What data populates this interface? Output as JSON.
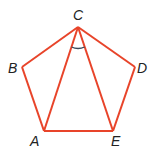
{
  "diagram": {
    "type": "regular-pentagon",
    "stroke_color": "#e8442a",
    "arc_color": "#3b4a5a",
    "label_color": "#222222",
    "vertices": {
      "A": {
        "label": "A",
        "x": 44,
        "y": 131
      },
      "B": {
        "label": "B",
        "x": 22,
        "y": 67
      },
      "C": {
        "label": "C",
        "x": 78,
        "y": 27
      },
      "D": {
        "label": "D",
        "x": 135,
        "y": 67
      },
      "E": {
        "label": "E",
        "x": 113,
        "y": 131
      }
    },
    "edges": [
      "AB",
      "BC",
      "CD",
      "DE",
      "EA"
    ],
    "diagonals": [
      "CA",
      "CE"
    ],
    "marked_angle": "ACE"
  }
}
